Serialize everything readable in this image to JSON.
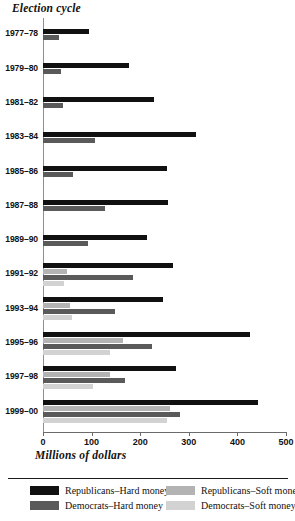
{
  "chart_data": {
    "type": "bar",
    "orientation": "horizontal",
    "title": "",
    "ylabel": "Election cycle",
    "xlabel": "Millions of dollars",
    "xlim": [
      0,
      500
    ],
    "xticks": [
      0,
      100,
      200,
      300,
      400,
      500
    ],
    "xtick_labels": [
      "0",
      "100",
      "200",
      "300",
      "400",
      "500"
    ],
    "grid": false,
    "legend_position": "bottom",
    "categories": [
      "1977–78",
      "1979–80",
      "1981–82",
      "1983–84",
      "1985–86",
      "1987–88",
      "1989–90",
      "1991–92",
      "1993–94",
      "1995–96",
      "1997–98",
      "1999–00"
    ],
    "series": [
      {
        "name": "Republicans–Hard money",
        "key": "rh",
        "color": "#111111",
        "values": [
          95,
          176,
          229,
          315,
          255,
          257,
          213,
          267,
          246,
          425,
          274,
          443
        ]
      },
      {
        "name": "Republicans–Soft money",
        "key": "rs",
        "color": "#b3b3b3",
        "values": [
          null,
          null,
          null,
          null,
          null,
          null,
          null,
          49,
          56,
          165,
          138,
          262
        ]
      },
      {
        "name": "Democrats–Hard money",
        "key": "dh",
        "color": "#5a5a5a",
        "values": [
          32,
          38,
          42,
          106,
          61,
          128,
          92,
          186,
          148,
          225,
          169,
          282
        ]
      },
      {
        "name": "Democrats–Soft money",
        "key": "ds",
        "color": "#d2d2d2",
        "values": [
          null,
          null,
          null,
          null,
          null,
          null,
          null,
          43,
          60,
          138,
          103,
          256
        ]
      }
    ]
  },
  "legend": {
    "entries": [
      {
        "label": "Republicans–Hard money",
        "color": "#111111"
      },
      {
        "label": "Republicans–Soft money",
        "color": "#b3b3b3"
      },
      {
        "label": "Democrats–Hard money",
        "color": "#5a5a5a"
      },
      {
        "label": "Democrats–Soft money",
        "color": "#d2d2d2"
      }
    ]
  }
}
